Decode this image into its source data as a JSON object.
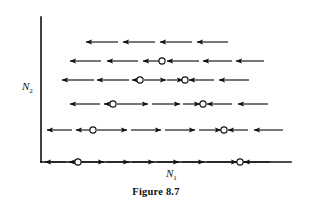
{
  "figure": {
    "caption": "Figure 8.7",
    "x_axis_label": "N",
    "x_axis_sub": "1",
    "y_axis_label": "N",
    "y_axis_sub": "2",
    "stroke_color": "#111111",
    "background_color": "#ffffff",
    "circle_fill": "#ffffff"
  },
  "axes": {
    "origin_x": 41,
    "origin_y": 162,
    "y_top": 17,
    "x_right": 291,
    "stroke_width": 1.6
  },
  "chart_data": {
    "type": "diagram",
    "title": "Figure 8.7",
    "xlabel": "N1",
    "ylabel": "N2",
    "rows": [
      {
        "index": 1,
        "y": 42,
        "arrows": [
          {
            "direction": "left",
            "x_start": 118,
            "x_end": 86
          },
          {
            "direction": "left",
            "x_start": 155,
            "x_end": 123
          },
          {
            "direction": "left",
            "x_start": 192,
            "x_end": 160
          },
          {
            "direction": "left",
            "x_start": 228,
            "x_end": 197
          }
        ],
        "circles": []
      },
      {
        "index": 2,
        "y": 61,
        "arrows": [
          {
            "direction": "left",
            "x_start": 101,
            "x_end": 70
          },
          {
            "direction": "left",
            "x_start": 138,
            "x_end": 107
          },
          {
            "direction": "left",
            "x_start": 160,
            "x_end": 143
          },
          {
            "direction": "left",
            "x_start": 199,
            "x_end": 167
          },
          {
            "direction": "left",
            "x_start": 232,
            "x_end": 203
          },
          {
            "direction": "left",
            "x_start": 264,
            "x_end": 236
          }
        ],
        "circles": [
          162
        ]
      },
      {
        "index": 3,
        "y": 80,
        "arrows": [
          {
            "direction": "left",
            "x_start": 94,
            "x_end": 62
          },
          {
            "direction": "left",
            "x_start": 129,
            "x_end": 97
          },
          {
            "direction": "left",
            "x_start": 138,
            "x_end": 132
          },
          {
            "direction": "right",
            "x_start": 144,
            "x_end": 166
          },
          {
            "direction": "right",
            "x_start": 167,
            "x_end": 183
          },
          {
            "direction": "left",
            "x_start": 214,
            "x_end": 189
          },
          {
            "direction": "left",
            "x_start": 249,
            "x_end": 219
          }
        ],
        "circles": [
          140,
          185
        ]
      },
      {
        "index": 4,
        "y": 104,
        "arrows": [
          {
            "direction": "left",
            "x_start": 100,
            "x_end": 70
          },
          {
            "direction": "left",
            "x_start": 110,
            "x_end": 104
          },
          {
            "direction": "right",
            "x_start": 117,
            "x_end": 148
          },
          {
            "direction": "right",
            "x_start": 152,
            "x_end": 180
          },
          {
            "direction": "right",
            "x_start": 183,
            "x_end": 200
          },
          {
            "direction": "left",
            "x_start": 232,
            "x_end": 207
          },
          {
            "direction": "left",
            "x_start": 268,
            "x_end": 238
          }
        ],
        "circles": [
          113,
          203
        ]
      },
      {
        "index": 5,
        "y": 130,
        "arrows": [
          {
            "direction": "left",
            "x_start": 72,
            "x_end": 47
          },
          {
            "direction": "left",
            "x_start": 90,
            "x_end": 76
          },
          {
            "direction": "right",
            "x_start": 97,
            "x_end": 127
          },
          {
            "direction": "right",
            "x_start": 131,
            "x_end": 161
          },
          {
            "direction": "right",
            "x_start": 165,
            "x_end": 195
          },
          {
            "direction": "right",
            "x_start": 199,
            "x_end": 221
          },
          {
            "direction": "left",
            "x_start": 248,
            "x_end": 228
          },
          {
            "direction": "left",
            "x_start": 283,
            "x_end": 254
          }
        ],
        "circles": [
          93,
          224
        ]
      },
      {
        "index": 6,
        "y": 162,
        "on_axis": true,
        "arrows": [
          {
            "direction": "left",
            "x_start": 66,
            "x_end": 45
          },
          {
            "direction": "left",
            "x_start": 76,
            "x_end": 69
          },
          {
            "direction": "right",
            "x_start": 82,
            "x_end": 104
          },
          {
            "direction": "right",
            "x_start": 107,
            "x_end": 129
          },
          {
            "direction": "right",
            "x_start": 132,
            "x_end": 154
          },
          {
            "direction": "right",
            "x_start": 157,
            "x_end": 179
          },
          {
            "direction": "right",
            "x_start": 182,
            "x_end": 204
          },
          {
            "direction": "right",
            "x_start": 207,
            "x_end": 237
          },
          {
            "direction": "left",
            "x_start": 270,
            "x_end": 244
          }
        ],
        "circles": [
          78,
          240
        ]
      }
    ],
    "x_label_pos": {
      "x": 166,
      "y": 177
    },
    "y_label_pos": {
      "x": 22,
      "y": 90
    }
  }
}
